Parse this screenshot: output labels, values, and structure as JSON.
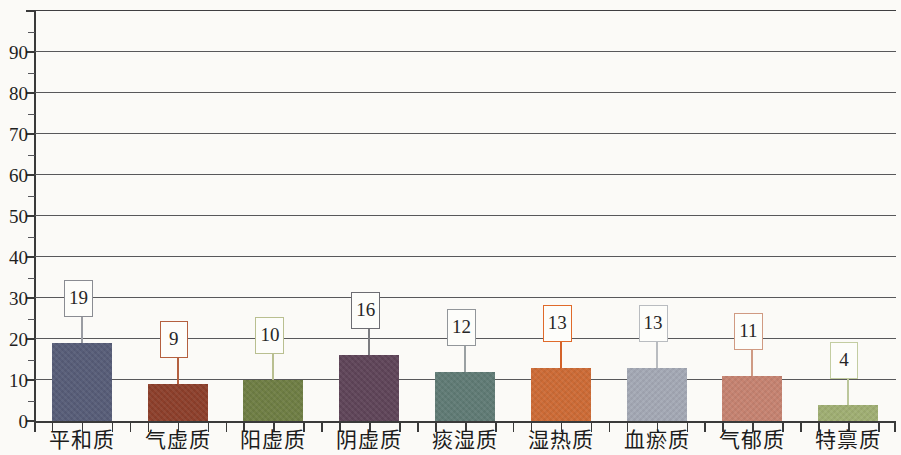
{
  "chart_data": {
    "type": "bar",
    "title": "",
    "subtitle": "",
    "xlabel": "",
    "ylabel": "",
    "ylim": [
      0,
      100
    ],
    "ytick_step": 10,
    "yminor_step": 5,
    "grid": true,
    "legend": "none",
    "categories": [
      "平和质",
      "气虚质",
      "阳虚质",
      "阴虚质",
      "痰湿质",
      "湿热质",
      "血瘀质",
      "气郁质",
      "特禀质"
    ],
    "values": [
      19,
      9,
      10,
      16,
      12,
      13,
      13,
      11,
      4
    ],
    "value_labels": [
      "19",
      "9",
      "10",
      "16",
      "12",
      "13",
      "13",
      "11",
      "4"
    ],
    "ytick_labels": [
      "0",
      "10",
      "20",
      "30",
      "40",
      "50",
      "60",
      "70",
      "80",
      "90"
    ],
    "bar_colors": [
      "#575d78",
      "#8d3f2b",
      "#6f7e44",
      "#5f4559",
      "#607b75",
      "#cd6b36",
      "#a4a9b5",
      "#c68371",
      "#a0af73"
    ],
    "label_border_colors": [
      "#8a8c92",
      "#b4603f",
      "#b9bf90",
      "#6d6d72",
      "#92969a",
      "#e06a2a",
      "#b9bcc0",
      "#d09a82",
      "#c3cda1"
    ],
    "leader_colors": [
      "#9a9ca2",
      "#b4603f",
      "#b9bf90",
      "#7c7c80",
      "#9aa0a2",
      "#d4622a",
      "#b9bcc0",
      "#cf9a84",
      "#bcc79b"
    ],
    "grid_color": "#58585a",
    "axis_color": "#3a3a3a",
    "background": "#fbfaf7"
  }
}
